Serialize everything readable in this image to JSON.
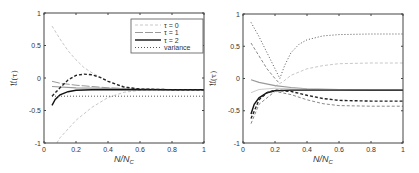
{
  "chart_data": [
    {
      "type": "line",
      "panel": "left",
      "xlabel": "N/N_C",
      "ylabel": "𝔘(τ)",
      "xlim": [
        0,
        1
      ],
      "ylim": [
        -1,
        1
      ],
      "xticks": [
        "0",
        "0.2",
        "0.4",
        "0.6",
        "0.8",
        "1"
      ],
      "yticks": [
        "-1",
        "-0.5",
        "0",
        "0.5",
        "1"
      ],
      "grid": false,
      "legend_position": "upper right",
      "legend": [
        "τ = 0",
        "τ = 1",
        "τ = 2",
        "variance"
      ],
      "series": [
        {
          "name": "τ = 0 (upper)",
          "style": "light dashed",
          "x": [
            0.05,
            0.1,
            0.15,
            0.2,
            0.25,
            0.3,
            0.4,
            0.5,
            0.6,
            0.8,
            1.0
          ],
          "y": [
            0.8,
            0.6,
            0.42,
            0.28,
            0.16,
            0.08,
            -0.05,
            -0.13,
            -0.17,
            -0.18,
            -0.18
          ]
        },
        {
          "name": "τ = 0 (lower)",
          "style": "light dashed",
          "x": [
            0.08,
            0.1,
            0.2,
            0.3,
            0.4,
            0.5,
            0.6,
            0.8,
            1.0
          ],
          "y": [
            -1.0,
            -0.92,
            -0.65,
            -0.45,
            -0.3,
            -0.22,
            -0.19,
            -0.18,
            -0.18
          ]
        },
        {
          "name": "τ = 1",
          "style": "gray solid-dash",
          "x": [
            0.05,
            0.1,
            0.2,
            0.3,
            0.4,
            0.5,
            0.6,
            0.8,
            1.0
          ],
          "y": [
            -0.05,
            -0.08,
            -0.11,
            -0.13,
            -0.15,
            -0.16,
            -0.17,
            -0.18,
            -0.18
          ]
        },
        {
          "name": "τ = 1 (flat)",
          "style": "gray solid",
          "x": [
            0.05,
            0.2,
            0.4,
            0.6,
            0.8,
            1.0
          ],
          "y": [
            -0.13,
            -0.15,
            -0.16,
            -0.17,
            -0.18,
            -0.18
          ]
        },
        {
          "name": "τ = 2 (solid)",
          "style": "black solid",
          "x": [
            0.05,
            0.07,
            0.1,
            0.15,
            0.2,
            0.3,
            0.4,
            0.6,
            0.8,
            1.0
          ],
          "y": [
            -0.42,
            -0.33,
            -0.26,
            -0.21,
            -0.19,
            -0.18,
            -0.18,
            -0.18,
            -0.18,
            -0.18
          ]
        },
        {
          "name": "τ = 2 (dashed)",
          "style": "black dashed",
          "x": [
            0.05,
            0.1,
            0.15,
            0.2,
            0.25,
            0.3,
            0.35,
            0.4,
            0.5,
            0.6,
            0.8,
            1.0
          ],
          "y": [
            -0.28,
            -0.15,
            -0.03,
            0.04,
            0.06,
            0.05,
            0.01,
            -0.05,
            -0.14,
            -0.17,
            -0.18,
            -0.18
          ]
        },
        {
          "name": "variance",
          "style": "dotted",
          "x": [
            0.05,
            0.2,
            0.4,
            0.6,
            0.8,
            1.0
          ],
          "y": [
            -0.28,
            -0.28,
            -0.28,
            -0.28,
            -0.28,
            -0.28
          ]
        }
      ]
    },
    {
      "type": "line",
      "panel": "right",
      "xlabel": "N/N_C",
      "ylabel": "𝔘(τ)",
      "xlim": [
        0,
        1
      ],
      "ylim": [
        -1,
        1
      ],
      "xticks": [
        "0",
        "0.2",
        "0.4",
        "0.6",
        "0.8",
        "1"
      ],
      "yticks": [
        "-1",
        "-0.5",
        "0",
        "0.5",
        "1"
      ],
      "grid": false,
      "series": [
        {
          "name": "variance",
          "style": "dotted",
          "x": [
            0.05,
            0.1,
            0.15,
            0.2,
            0.23,
            0.26,
            0.3,
            0.35,
            0.4,
            0.5,
            0.6,
            0.8,
            1.0
          ],
          "y": [
            0.87,
            0.65,
            0.4,
            0.15,
            0.0,
            0.2,
            0.4,
            0.53,
            0.6,
            0.66,
            0.68,
            0.69,
            0.69
          ]
        },
        {
          "name": "τ = 0 (upper dashed)",
          "style": "gray dashed",
          "x": [
            0.05,
            0.1,
            0.15,
            0.2,
            0.23
          ],
          "y": [
            0.55,
            0.35,
            0.15,
            0.0,
            -0.08
          ]
        },
        {
          "name": "τ = 0 (light)",
          "style": "light dashed",
          "x": [
            0.2,
            0.25,
            0.3,
            0.4,
            0.5,
            0.6,
            0.8,
            1.0
          ],
          "y": [
            -0.12,
            -0.05,
            0.05,
            0.15,
            0.2,
            0.23,
            0.24,
            0.24
          ]
        },
        {
          "name": "τ = 1",
          "style": "gray solid",
          "x": [
            0.05,
            0.1,
            0.2,
            0.3,
            0.4,
            0.6,
            0.8,
            1.0
          ],
          "y": [
            -0.02,
            -0.06,
            -0.11,
            -0.14,
            -0.16,
            -0.17,
            -0.18,
            -0.18
          ]
        },
        {
          "name": "τ = 1 (light)",
          "style": "light solid",
          "x": [
            0.05,
            0.1,
            0.2,
            0.3,
            0.5,
            1.0
          ],
          "y": [
            -0.22,
            -0.17,
            -0.15,
            -0.16,
            -0.17,
            -0.18
          ]
        },
        {
          "name": "τ = 2 (solid)",
          "style": "black solid",
          "x": [
            0.05,
            0.07,
            0.1,
            0.15,
            0.2,
            0.3,
            0.5,
            1.0
          ],
          "y": [
            -0.55,
            -0.4,
            -0.3,
            -0.22,
            -0.19,
            -0.18,
            -0.18,
            -0.18
          ]
        },
        {
          "name": "τ = 2 (dashed)",
          "style": "black dashed",
          "x": [
            0.05,
            0.08,
            0.1,
            0.15,
            0.2,
            0.3,
            0.4,
            0.5,
            0.6,
            0.8,
            1.0
          ],
          "y": [
            -0.62,
            -0.45,
            -0.33,
            -0.22,
            -0.18,
            -0.2,
            -0.26,
            -0.31,
            -0.34,
            -0.35,
            -0.35
          ]
        },
        {
          "name": "τ = 1 (dashed lower)",
          "style": "gray dashed",
          "x": [
            0.05,
            0.1,
            0.2,
            0.3,
            0.4,
            0.5,
            0.6,
            0.8,
            1.0
          ],
          "y": [
            -0.7,
            -0.4,
            -0.2,
            -0.25,
            -0.33,
            -0.39,
            -0.42,
            -0.43,
            -0.43
          ]
        }
      ]
    }
  ]
}
